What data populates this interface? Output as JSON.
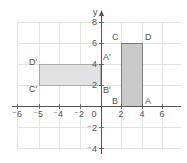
{
  "diagram": {
    "type": "coordinate-plane",
    "axis_labels": {
      "y": "y"
    },
    "x_ticks": [
      {
        "label": "⁻6",
        "px": 17
      },
      {
        "label": "⁻5",
        "px": 39
      },
      {
        "label": "⁻4",
        "px": 59
      },
      {
        "label": "⁻2",
        "px": 80
      },
      {
        "label": "0",
        "px": 94
      },
      {
        "label": "2",
        "px": 121
      },
      {
        "label": "4",
        "px": 142
      },
      {
        "label": "6",
        "px": 162
      }
    ],
    "y_ticks": [
      {
        "label": "8",
        "py": 22
      },
      {
        "label": "6",
        "py": 43
      },
      {
        "label": "4",
        "py": 64
      },
      {
        "label": "2",
        "py": 85
      },
      {
        "label": "⁻2",
        "py": 128
      },
      {
        "label": "⁻4",
        "py": 149
      }
    ],
    "shapes": [
      {
        "name": "rectangle-ABCD",
        "vertices": {
          "A": [
            4,
            0
          ],
          "B": [
            2,
            0
          ],
          "C": [
            2,
            6
          ],
          "D": [
            4,
            6
          ]
        },
        "fill": "#c9c9c9",
        "labels": [
          {
            "text": "A",
            "px": 145,
            "py": 104
          },
          {
            "text": "B",
            "px": 112,
            "py": 104
          },
          {
            "text": "C",
            "px": 112,
            "py": 40
          },
          {
            "text": "D",
            "px": 145,
            "py": 40
          }
        ]
      },
      {
        "name": "rectangle-A'B'C'D'",
        "vertices": {
          "A'": [
            0,
            4
          ],
          "B'": [
            0,
            2
          ],
          "C'": [
            -5,
            2
          ],
          "D'": [
            -5,
            4
          ]
        },
        "fill": "#e2e2e2",
        "labels": [
          {
            "text": "A'",
            "px": 103,
            "py": 60
          },
          {
            "text": "B'",
            "px": 103,
            "py": 93
          },
          {
            "text": "C'",
            "px": 29,
            "py": 92
          },
          {
            "text": "D'",
            "px": 29,
            "py": 65
          }
        ]
      }
    ],
    "colors": {
      "grid": "#e4e4e4",
      "axis": "#555555",
      "shape_outline": "#666666"
    }
  }
}
